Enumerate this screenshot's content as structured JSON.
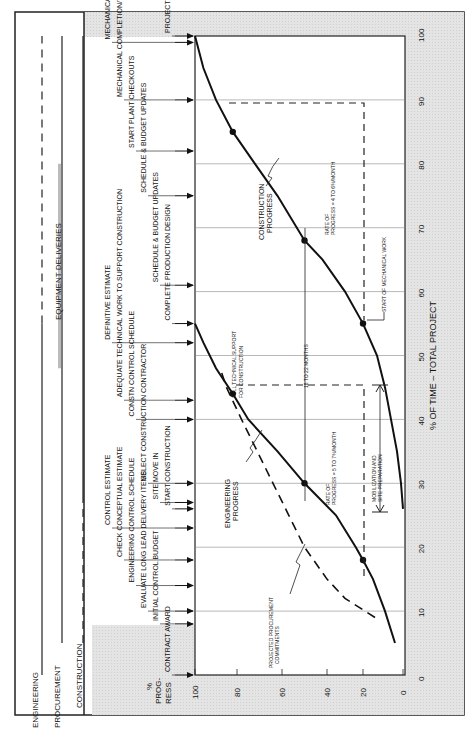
{
  "chart_data": {
    "type": "line",
    "orientation_note": "figure rendered rotated 90 degrees counter-clockwise",
    "title": "",
    "xlabel": "% OF TIME – TOTAL PROJECT",
    "ylabel": "% PROG-RESS",
    "xlim": [
      0,
      100
    ],
    "ylim": [
      0,
      100
    ],
    "x_ticks": [
      "0",
      "10",
      "20",
      "30",
      "40",
      "50",
      "60",
      "70",
      "80",
      "90",
      "100"
    ],
    "y_ticks": [
      "0",
      "20",
      "40",
      "60",
      "80",
      "100"
    ],
    "grid": true,
    "series": [
      {
        "name": "ENGINEERING PROGRESS",
        "style": "solid",
        "points": [
          [
            5,
            4
          ],
          [
            10,
            9
          ],
          [
            15,
            15
          ],
          [
            18,
            20
          ],
          [
            20,
            24
          ],
          [
            25,
            35
          ],
          [
            30,
            50
          ],
          [
            35,
            62
          ],
          [
            40,
            75
          ],
          [
            44,
            82
          ],
          [
            48,
            90
          ],
          [
            52,
            96
          ],
          [
            55,
            100
          ]
        ]
      },
      {
        "name": "PROJECTED PROCUREMENT COMMITMENTS",
        "style": "dashed",
        "points": [
          [
            9,
            14
          ],
          [
            12,
            30
          ],
          [
            15,
            40
          ],
          [
            20,
            50
          ],
          [
            25,
            57
          ],
          [
            30,
            64
          ],
          [
            35,
            71
          ],
          [
            40,
            78
          ],
          [
            45,
            85
          ],
          [
            48,
            88
          ]
        ]
      },
      {
        "name": "CONSTRUCTION PROGRESS",
        "style": "solid",
        "points": [
          [
            26,
            0
          ],
          [
            30,
            1
          ],
          [
            35,
            3
          ],
          [
            40,
            6
          ],
          [
            45,
            9
          ],
          [
            50,
            13
          ],
          [
            55,
            20
          ],
          [
            60,
            30
          ],
          [
            65,
            42
          ],
          [
            68,
            50
          ],
          [
            75,
            62
          ],
          [
            80,
            72
          ],
          [
            85,
            82
          ],
          [
            90,
            90
          ],
          [
            95,
            96
          ],
          [
            100,
            100
          ]
        ]
      }
    ],
    "markers": [
      {
        "series": "ENGINEERING PROGRESS",
        "x": 18,
        "y": 20
      },
      {
        "series": "ENGINEERING PROGRESS",
        "x": 30,
        "y": 50
      },
      {
        "series": "ENGINEERING PROGRESS",
        "x": 44,
        "y": 82
      },
      {
        "series": "CONSTRUCTION PROGRESS",
        "x": 55,
        "y": 20
      },
      {
        "series": "CONSTRUCTION PROGRESS",
        "x": 68,
        "y": 50
      },
      {
        "series": "CONSTRUCTION PROGRESS",
        "x": 85,
        "y": 82
      }
    ],
    "annotations": [
      "ENGINEERING PROGRESS",
      "PROJECTED PROCUREMENT COMMITMENTS",
      "CONSTRUCTION PROGRESS",
      "FULL TECHNICAL SUPPORT FOR CONSTRUCTION",
      "18 TO 22 MONTHS",
      "RATE OF PROGRESS = 5 TO 7%/MONTH",
      "RATE OF PROGRESS = 4 TO 6%/MONTH",
      "MOBILIZATION AND SITE PREPARATION",
      "START OF MECHANICAL WORK"
    ],
    "milestones": [
      {
        "x": 0,
        "label": "CONTRACT AWARD"
      },
      {
        "x": 8,
        "label": "INITIAL CONTROL BUDGET"
      },
      {
        "x": 10,
        "label": "EVALUATE LONG LEAD DELIVERY ITEMS"
      },
      {
        "x": 14,
        "label": "ENGINEERING CONTROL SCHEDULE"
      },
      {
        "x": 18,
        "label": "CHECK CONCEPTUAL ESTIMATE"
      },
      {
        "x": 23,
        "label": "CONTROL ESTIMATE"
      },
      {
        "x": 26,
        "label": "START CONSTRUCTION"
      },
      {
        "x": 27,
        "label": "SITE MOVE IN"
      },
      {
        "x": 30,
        "label": "SELECT CONSTRUCTION CONTRACTOR"
      },
      {
        "x": 40,
        "label": "CONSTN CONTROL SCHEDULE"
      },
      {
        "x": 43,
        "label": "ADEQUATE TECHNICAL WORK TO SUPPORT CONSTRUCTION"
      },
      {
        "x": 52,
        "label": "DEFINITIVE ESTIMATE"
      },
      {
        "x": 55,
        "label": "COMPLETE PRODUCTION DESIGN"
      },
      {
        "x": 61,
        "label": "SCHEDULE & BUDGET UPDATES"
      },
      {
        "x": 75,
        "label": "SCHEDULE & BUDGET UPDATES"
      },
      {
        "x": 82,
        "label": "START PLANT CHECKOUTS"
      },
      {
        "x": 90,
        "label": "MECHANICAL COMPLETION/TURNOVER PERIOD –START"
      },
      {
        "x": 99,
        "label": "MECHANICAL COMPLETION/TURNOVER PERIOD – COMPLETE"
      },
      {
        "x": 100,
        "label": "PROJECT COMPLETION"
      }
    ],
    "phase_bars": [
      {
        "label": "ENGINEERING",
        "solid": [
          0,
          55
        ],
        "dashed": [
          55,
          100
        ]
      },
      {
        "label": "PROCUREMENT",
        "solid": [
          5,
          100
        ],
        "note": "EQUIPMENT DELIVERIES",
        "shaded": [
          48,
          80
        ]
      },
      {
        "label": "CONSTRUCTION",
        "dashed": [
          5,
          28
        ],
        "solid": [
          28,
          100
        ]
      }
    ]
  },
  "labels": {
    "engineering": "ENGINEERING",
    "procurement": "PROCUREMENT",
    "construction": "CONSTRUCTION",
    "equipment_deliveries": "EQUIPMENT DELIVERIES",
    "yaxis_l1": "%",
    "yaxis_l2": "PROG-",
    "yaxis_l3": "RESS",
    "xaxis": "% OF TIME – TOTAL PROJECT",
    "eng_progress_1": "ENGINEERING",
    "eng_progress_2": "PROGRESS",
    "con_progress_1": "CONSTRUCTION",
    "con_progress_2": "PROGRESS",
    "proc_1": "PROJECTED PROCUREMENT",
    "proc_2": "COMMITMENTS",
    "full_tech_1": "FULL TECHNICAL SUPPORT",
    "full_tech_2": "FOR CONSTRUCTION",
    "months": "18 TO 22 MONTHS",
    "rate1_1": "RATE OF",
    "rate1_2": "PROGRESS = 5 TO 7%/MONTH",
    "rate2_1": "RATE OF",
    "rate2_2": "PROGRESS = 4 TO 6%/MONTH",
    "mob_1": "MOBILIZATION AND",
    "mob_2": "SITE PREPARATION",
    "start_mech": "START OF MECHANICAL WORK"
  }
}
